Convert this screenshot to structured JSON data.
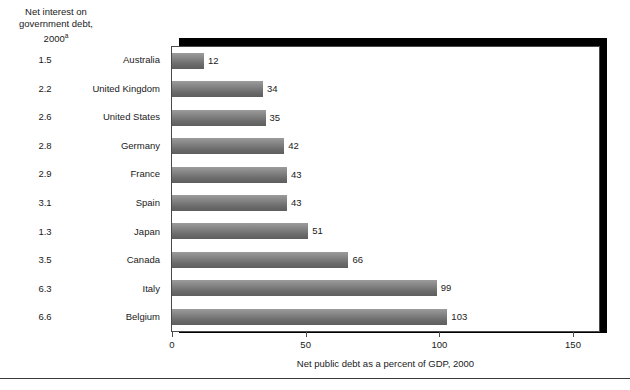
{
  "chart_data": {
    "type": "bar",
    "orientation": "horizontal",
    "title": "",
    "header_label": "Net interest on\ngovernment debt,\n2000",
    "header_superscript": "a",
    "xlabel": "Net public debt as a percent of GDP, 2000",
    "ylabel": "",
    "xlim": [
      0,
      150
    ],
    "xticks": [
      0,
      50,
      100,
      150
    ],
    "xtick_labels": [
      "0",
      "50",
      "100",
      "150"
    ],
    "grid": false,
    "legend": null,
    "categories": [
      "Australia",
      "United Kingdom",
      "United States",
      "Germany",
      "France",
      "Spain",
      "Japan",
      "Canada",
      "Italy",
      "Belgium"
    ],
    "values": [
      12,
      34,
      35,
      42,
      43,
      43,
      51,
      66,
      99,
      103
    ],
    "secondary_column": {
      "name": "Net interest on government debt, 2000",
      "values": [
        "1.5",
        "2.2",
        "2.6",
        "2.8",
        "2.9",
        "3.1",
        "1.3",
        "3.5",
        "6.3",
        "6.6"
      ]
    },
    "bar_color_top": "#9c9c9c",
    "bar_color_bottom": "#5e5e5e",
    "frame_color": "#4a4a4a",
    "shadow_color": "#000000"
  }
}
